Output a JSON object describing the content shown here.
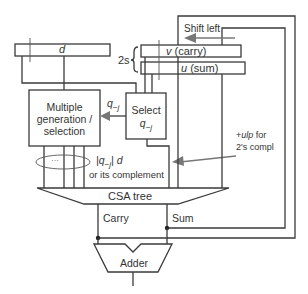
{
  "diagram": {
    "registers": {
      "divisor": {
        "label": "d"
      },
      "carry": {
        "label_var": "v",
        "label_text": "(carry)"
      },
      "sum": {
        "label_var": "u",
        "label_text": "(sum)"
      },
      "width_label": "2s"
    },
    "blocks": {
      "multiple_gen": {
        "lines": [
          "Multiple",
          "generation /",
          "selection"
        ]
      },
      "select": {
        "line1": "Select",
        "line2": "q",
        "line2_sub": "−j"
      },
      "csa": {
        "label": "CSA tree"
      },
      "adder": {
        "label": "Adder"
      }
    },
    "annotations": {
      "shift_left": "Shift left",
      "q_signal": "q",
      "q_signal_sub": "−j",
      "ellipsis": "···",
      "multiple_expr_a": "|q",
      "multiple_expr_sub": "−j",
      "multiple_expr_b": "| d",
      "or_complement": "or its complement",
      "ulp_prefix": "+",
      "ulp_var": "ulp",
      "ulp_suffix": " for",
      "twos_compl": "2's compl",
      "carry_out": "Carry",
      "sum_out": "Sum"
    },
    "colors": {
      "line": "#3a3a3a",
      "arrow": "#777777",
      "text": "#333333",
      "background": "#ffffff"
    }
  }
}
